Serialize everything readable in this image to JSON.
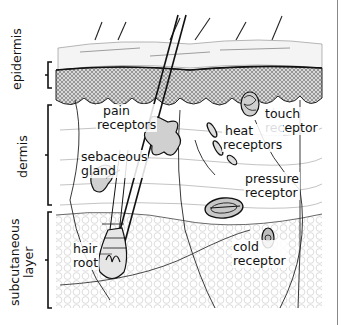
{
  "diagram": {
    "layers": [
      {
        "id": "epidermis",
        "label": "epidermis"
      },
      {
        "id": "dermis",
        "label": "dermis"
      },
      {
        "id": "subcutaneous",
        "label_line1": "subcutaneous",
        "label_line2": "layer"
      }
    ],
    "structures": {
      "pain": {
        "line1": "pain",
        "line2": "receptors"
      },
      "sebaceous": {
        "line1": "sebaceous",
        "line2": "gland"
      },
      "touch": {
        "line1": "touch",
        "line2": "receptor"
      },
      "heat": {
        "line1": "heat",
        "line2": "receptors"
      },
      "pressure": {
        "line1": "pressure",
        "line2": "receptor"
      },
      "hair_root": {
        "line1": "hair",
        "line2": "root"
      },
      "cold": {
        "line1": "cold",
        "line2": "receptor"
      }
    },
    "colors": {
      "ink": "#111111",
      "background": "#ffffff",
      "stipple": "#bbbbbb"
    }
  }
}
